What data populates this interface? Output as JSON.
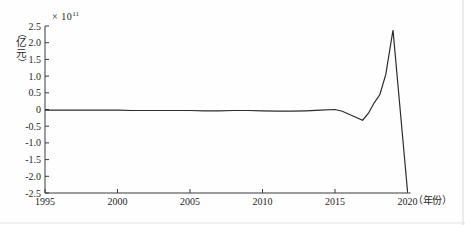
{
  "figure": {
    "scale_multiplier": {
      "base": "× 10",
      "exponent": "11"
    },
    "ylabel_text": "（亿元）",
    "ylabel_chars": [
      "（",
      "亿",
      "元",
      "）"
    ],
    "xlabel_text": "（年份）"
  },
  "chart_data": {
    "type": "line",
    "title": "",
    "xlabel": "（年份）",
    "ylabel": "（亿元）",
    "y_scale_note": "values are ×10^11 亿元",
    "xlim": [
      1995,
      2020
    ],
    "ylim": [
      -2.5,
      2.5
    ],
    "grid": false,
    "legend": null,
    "x_ticks": [
      1995,
      2000,
      2005,
      2010,
      2015,
      2020
    ],
    "x_tick_labels": [
      "1995",
      "2000",
      "2005",
      "2010",
      "2015",
      "2020"
    ],
    "y_ticks": [
      2.5,
      2.0,
      1.5,
      1.0,
      0.5,
      0,
      -0.5,
      -1.0,
      -1.5,
      -2.0,
      -2.5
    ],
    "y_tick_labels": [
      "2.5",
      "2.0",
      "1.5",
      "1.0",
      "0.5",
      "0",
      "-0.5",
      "-1.0",
      "-1.5",
      "-2.0",
      "-2.5"
    ],
    "line_color": "#2b2b2b",
    "series": [
      {
        "name": "value",
        "points": [
          [
            1995,
            -0.02
          ],
          [
            1996,
            -0.02
          ],
          [
            1997,
            -0.02
          ],
          [
            1998,
            -0.02
          ],
          [
            1999,
            -0.02
          ],
          [
            2000,
            -0.02
          ],
          [
            2001,
            -0.03
          ],
          [
            2002,
            -0.03
          ],
          [
            2003,
            -0.03
          ],
          [
            2004,
            -0.03
          ],
          [
            2005,
            -0.03
          ],
          [
            2006,
            -0.04
          ],
          [
            2007,
            -0.04
          ],
          [
            2008,
            -0.03
          ],
          [
            2009,
            -0.03
          ],
          [
            2010,
            -0.04
          ],
          [
            2011,
            -0.05
          ],
          [
            2012,
            -0.05
          ],
          [
            2013,
            -0.04
          ],
          [
            2014,
            -0.02
          ],
          [
            2015,
            0.0
          ],
          [
            2015.5,
            -0.05
          ],
          [
            2016,
            -0.15
          ],
          [
            2016.9,
            -0.32
          ],
          [
            2017.3,
            -0.12
          ],
          [
            2017.7,
            0.2
          ],
          [
            2018.1,
            0.45
          ],
          [
            2018.5,
            1.05
          ],
          [
            2019,
            2.38
          ],
          [
            2020,
            -2.45
          ]
        ]
      }
    ]
  },
  "layout_px": {
    "plot_left": 45,
    "plot_right": 407.5,
    "plot_top": 26,
    "plot_bottom": 193,
    "axis_overhang": 3,
    "tick_len": 4
  }
}
